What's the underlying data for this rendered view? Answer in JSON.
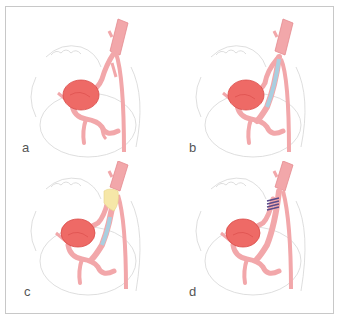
{
  "figure": {
    "colors": {
      "border": "#c8c8c8",
      "vessel": "#f2a7aa",
      "vessel_stroke": "#e58a8f",
      "aneurysm": "#ee6a66",
      "aneurysm_dark": "#d94a48",
      "stent_blue": "#a9cfe0",
      "graft_yellow": "#f6e7a8",
      "clip_purple": "#5a4a8a",
      "sketch": "#d6d6d6",
      "label": "#555555"
    },
    "panels": [
      {
        "id": "a",
        "label": "a",
        "description": "Splenic artery aneurysm (untreated)",
        "treatment": "none"
      },
      {
        "id": "b",
        "label": "b",
        "description": "Stent-graft placement across aneurysm inflow",
        "treatment": "stent"
      },
      {
        "id": "c",
        "label": "c",
        "description": "Stent with proximal graft/covering (yellow) at origin",
        "treatment": "stent_graft"
      },
      {
        "id": "d",
        "label": "d",
        "description": "Surgical ligation / clips at vessel origin",
        "treatment": "ligation_clips"
      }
    ]
  }
}
